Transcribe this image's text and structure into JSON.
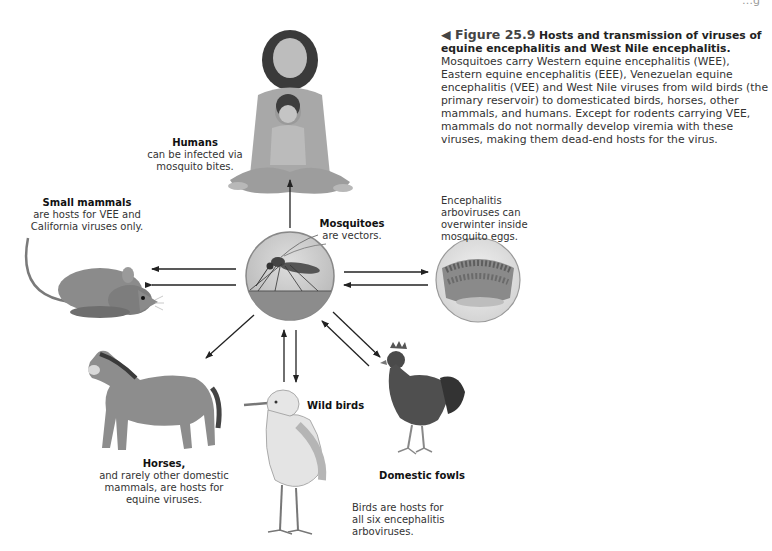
{
  "running_header": "…g",
  "caption": {
    "figure_number": "◀ Figure 25.9",
    "title": "Hosts and transmission of viruses of equine encephalitis and West Nile encephalitis.",
    "body": "Mosquitoes carry Western equine encephalitis (WEE), Eastern equine encephalitis (EEE), Venezuelan equine encephalitis (VEE) and West Nile viruses from wild birds (the primary reservoir) to domesticated birds, horses, other mammals, and humans. Except for rodents carrying VEE, mammals do not normally develop viremia with these viruses, making them dead-end hosts for the virus."
  },
  "nodes": {
    "humans": {
      "title": "Humans",
      "text": "can be infected via mosquito bites.",
      "icon": "humans-illustration"
    },
    "mosquitoes": {
      "title": "Mosquitoes",
      "text": "are vectors.",
      "icon": "mosquito-illustration"
    },
    "eggs": {
      "title": "",
      "text": "Encephalitis arboviruses can overwinter inside mosquito eggs.",
      "icon": "mosquito-eggs-illustration"
    },
    "small_mammals": {
      "title": "Small mammals",
      "text": "are hosts for VEE and California viruses only.",
      "icon": "rodent-illustration"
    },
    "horses": {
      "title": "Horses,",
      "text": "and rarely other domestic mammals, are hosts for equine viruses.",
      "icon": "horse-illustration"
    },
    "wild_birds": {
      "title": "Wild birds",
      "text": "",
      "icon": "egret-illustration"
    },
    "domestic_fowls": {
      "title": "Domestic fowls",
      "text": "",
      "icon": "rooster-illustration"
    },
    "birds_note": {
      "text": "Birds are hosts for all six encephalitis arboviruses."
    }
  },
  "arrows": [
    {
      "from": "mosquitoes",
      "to": "humans"
    },
    {
      "from": "mosquitoes",
      "to": "small_mammals"
    },
    {
      "from": "small_mammals",
      "to": "mosquitoes"
    },
    {
      "from": "mosquitoes",
      "to": "eggs"
    },
    {
      "from": "eggs",
      "to": "mosquitoes"
    },
    {
      "from": "mosquitoes",
      "to": "horses"
    },
    {
      "from": "wild_birds",
      "to": "mosquitoes"
    },
    {
      "from": "mosquitoes",
      "to": "wild_birds"
    },
    {
      "from": "mosquitoes",
      "to": "domestic_fowls"
    },
    {
      "from": "domestic_fowls",
      "to": "mosquitoes"
    }
  ],
  "colors": {
    "arrow": "#222222",
    "circle_sky": "#c8c8c8",
    "circle_ground": "#8f8f8f",
    "text": "#333333"
  }
}
